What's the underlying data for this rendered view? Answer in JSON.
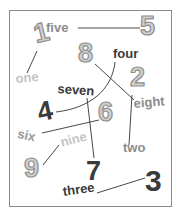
{
  "puzzle": {
    "type": "match-number-words-to-digits",
    "words": {
      "one": "one",
      "two": "two",
      "three": "three",
      "four": "four",
      "five": "five",
      "six": "six",
      "seven": "seven",
      "eight": "eight",
      "nine": "nine"
    },
    "digits": {
      "d1": "1",
      "d2": "2",
      "d3": "3",
      "d4": "4",
      "d5": "5",
      "d6": "6",
      "d7": "7",
      "d8": "8",
      "d9": "9"
    },
    "connections": [
      {
        "word": "one",
        "digit": "1"
      },
      {
        "word": "five",
        "digit": "5"
      },
      {
        "word": "eight",
        "digit": "8"
      },
      {
        "word": "four",
        "digit": "4"
      },
      {
        "word": "two",
        "digit": "2"
      },
      {
        "word": "seven",
        "digit": "7"
      },
      {
        "word": "six",
        "digit": "6"
      },
      {
        "word": "nine",
        "digit": "9"
      },
      {
        "word": "three",
        "digit": "3"
      }
    ],
    "colors": {
      "frame": "#8a8a8a",
      "line": "#333333",
      "dark_text": "#3a3a3a",
      "mid_text": "#8c8c8c",
      "light_text": "#bdbdbd",
      "outline_fill": "#d0d0d0",
      "outline_stroke": "#8f8f8f"
    }
  }
}
